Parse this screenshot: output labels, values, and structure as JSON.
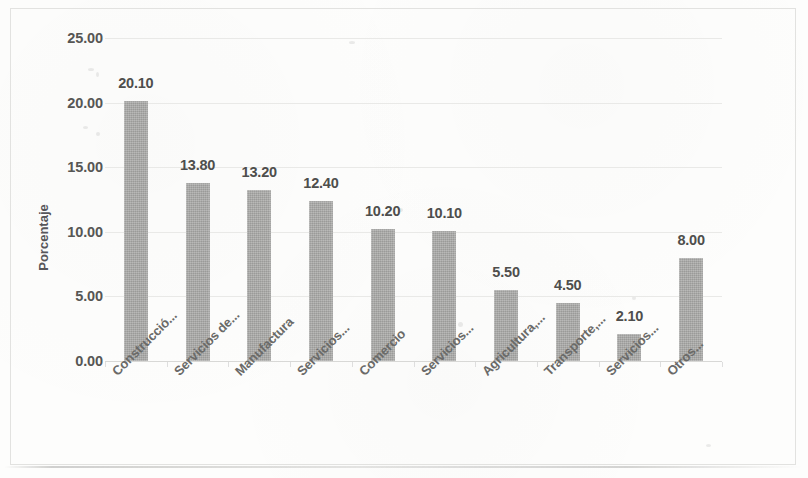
{
  "chart_data": {
    "type": "bar",
    "title": "",
    "xlabel": "",
    "ylabel": "Porcentaje",
    "ylim": [
      0,
      25
    ],
    "ytick_labels": [
      "0.00",
      "5.00",
      "10.00",
      "15.00",
      "20.00",
      "25.00"
    ],
    "ytick_values": [
      0,
      5,
      10,
      15,
      20,
      25
    ],
    "grid": true,
    "legend": "none",
    "bar_color": "#a9a9a7",
    "categories": [
      "Construcció...",
      "Servicios de...",
      "Manufactura",
      "Servicios...",
      "Comercio",
      "Servicios...",
      "Agricultura,...",
      "Transporte,...",
      "Servicios...",
      "Otros..."
    ],
    "values": [
      20.1,
      13.8,
      13.2,
      12.4,
      10.2,
      10.1,
      5.5,
      4.5,
      2.1,
      8.0
    ],
    "data_labels": [
      "20.10",
      "13.80",
      "13.20",
      "12.40",
      "10.20",
      "10.10",
      "5.50",
      "4.50",
      "2.10",
      "8.00"
    ]
  }
}
